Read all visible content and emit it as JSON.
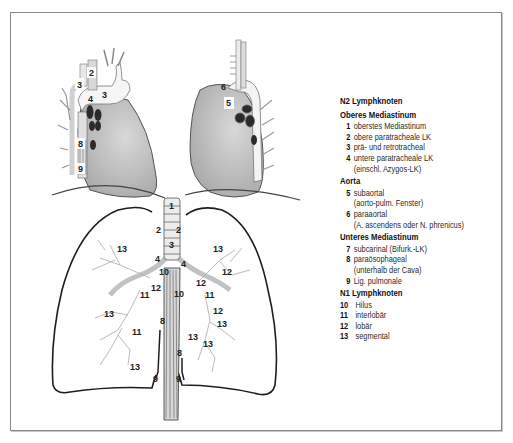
{
  "legend": {
    "title": "N2 Lymphknoten",
    "sections": [
      {
        "heading": "Oberes Mediastinum",
        "items": [
          {
            "num": "1",
            "label": "oberstes Mediastinum",
            "sub": ""
          },
          {
            "num": "2",
            "label": "obere paratracheale LK",
            "sub": ""
          },
          {
            "num": "3",
            "label": "prä- und retrotracheal",
            "sub": ""
          },
          {
            "num": "4",
            "label": "untere paratracheale LK",
            "sub": "(einschl. Azygos-LK)"
          }
        ]
      },
      {
        "heading": "Aorta",
        "items": [
          {
            "num": "5",
            "label": "subaortal",
            "sub": "(aorto-pulm. Fenster)"
          },
          {
            "num": "6",
            "label": "paraaortal",
            "sub": "(A. ascendens oder N. phrenicus)"
          }
        ]
      },
      {
        "heading": "Unteres Mediastinum",
        "items": [
          {
            "num": "7",
            "label": "subcarinal (Bifurk.-LK)",
            "sub": ""
          },
          {
            "num": "8",
            "label": "paraösophageal",
            "sub": "(unterhalb der Cava)"
          },
          {
            "num": "9",
            "label": "Lig. pulmonale",
            "sub": ""
          }
        ]
      },
      {
        "heading": "N1 Lymphknoten",
        "items": [
          {
            "num": "10",
            "label": "Hilus",
            "sub": ""
          },
          {
            "num": "11",
            "label": "interlobär",
            "sub": ""
          },
          {
            "num": "12",
            "label": "lobär",
            "sub": ""
          },
          {
            "num": "13",
            "label": "segmental",
            "sub": ""
          }
        ]
      }
    ]
  },
  "diagram": {
    "left_mediastinum_labels": [
      "2",
      "3",
      "3",
      "4",
      "8",
      "9"
    ],
    "right_mediastinum_labels": [
      "6",
      "5"
    ],
    "lung_labels": {
      "trachea": [
        "1",
        "2",
        "2",
        "3",
        "4",
        "4"
      ],
      "hilus": [
        "10",
        "10"
      ],
      "left_lung": [
        "13",
        "12",
        "11",
        "13",
        "11",
        "13"
      ],
      "right_lung": [
        "13",
        "12",
        "12",
        "11",
        "12",
        "13",
        "13",
        "13"
      ],
      "esophagus": [
        "8",
        "8",
        "9",
        "9"
      ]
    }
  },
  "colors": {
    "heart_fill": "#c9c9c9",
    "heart_shadow": "#a9a9a9",
    "node_fill": "#2b2b2b",
    "outline": "#1e1e1e",
    "frame": "#8a8a8a"
  }
}
